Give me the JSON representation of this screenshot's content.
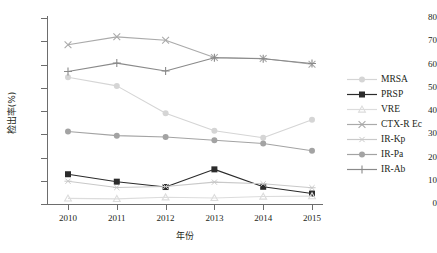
{
  "chart_data": {
    "type": "line",
    "title": "",
    "xlabel": "年份",
    "ylabel": "检出率(%)",
    "categories": [
      "2010",
      "2011",
      "2012",
      "2013",
      "2014",
      "2015"
    ],
    "x": [
      2010,
      2011,
      2012,
      2013,
      2014,
      2015
    ],
    "ylim": [
      0,
      80
    ],
    "yticks": [
      0,
      10,
      20,
      30,
      40,
      50,
      60,
      70,
      80
    ],
    "grid": false,
    "legend_position": "right",
    "series": [
      {
        "name": "MRSA",
        "marker": "circle",
        "color": "#d5d5d5",
        "values": [
          54.5,
          50.8,
          39.0,
          31.5,
          28.5,
          36.2
        ]
      },
      {
        "name": "PRSP",
        "marker": "square",
        "color": "#2b2b2b",
        "values": [
          12.8,
          9.6,
          7.3,
          14.9,
          7.4,
          4.5
        ]
      },
      {
        "name": "VRE",
        "marker": "triangle",
        "color": "#dcdcdc",
        "values": [
          2.4,
          2.2,
          2.9,
          2.6,
          3.2,
          3.4
        ]
      },
      {
        "name": "CTX-R Ec",
        "marker": "cross-x",
        "color": "#aaaaaa",
        "values": [
          68.5,
          71.9,
          70.4,
          63.0,
          62.6,
          60.1
        ]
      },
      {
        "name": "IR-Kp",
        "marker": "asterisk",
        "color": "#c9c9c9",
        "values": [
          9.8,
          7.1,
          7.5,
          9.4,
          8.7,
          7.0
        ]
      },
      {
        "name": "IR-Pa",
        "marker": "circle-dark",
        "color": "#a3a3a3",
        "values": [
          31.2,
          29.4,
          28.8,
          27.4,
          26.0,
          22.9
        ]
      },
      {
        "name": "IR-Ab",
        "marker": "plus",
        "color": "#8a8a8a",
        "values": [
          57.0,
          60.6,
          57.2,
          62.9,
          62.5,
          60.4
        ]
      }
    ]
  },
  "legend": {
    "items": [
      {
        "label": "MRSA"
      },
      {
        "label": "PRSP"
      },
      {
        "label": "VRE"
      },
      {
        "label": "CTX-R Ec"
      },
      {
        "label": "IR-Kp"
      },
      {
        "label": "IR-Pa"
      },
      {
        "label": "IR-Ab"
      }
    ]
  }
}
